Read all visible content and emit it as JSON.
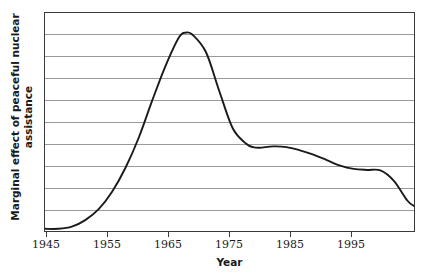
{
  "chart_data": {
    "type": "line",
    "title": "",
    "xlabel": "Year",
    "ylabel": "Marginal effect of peaceful nuclear assistance",
    "ylabel_line1": "Marginal effect of peaceful nuclear",
    "ylabel_line2": "assistance",
    "xlim": [
      1945,
      2000
    ],
    "ylim": [
      0,
      10
    ],
    "xticks": [
      1945,
      1955,
      1965,
      1975,
      1985,
      1995
    ],
    "xticklabels": [
      "1945",
      "1955",
      "1965",
      "1975",
      "1985",
      "1995"
    ],
    "yticks": [],
    "yticklabels": [],
    "grid": "horizontal",
    "gridline_count": 9,
    "legend": "none",
    "line_color": "#1a1a1a",
    "grid_color": "#9a9a9a",
    "frame_color": "#3a3a3a",
    "series": [
      {
        "name": "Marginal effect of peaceful nuclear assistance",
        "x": [
          1945,
          1947,
          1949,
          1951,
          1953,
          1955,
          1957,
          1959,
          1961,
          1963,
          1965,
          1966,
          1967,
          1969,
          1971,
          1973,
          1975,
          1976,
          1977,
          1979,
          1981,
          1983,
          1985,
          1987,
          1989,
          1991,
          1993,
          1995,
          1997,
          1999,
          2000
        ],
        "values": [
          0.1,
          0.1,
          0.2,
          0.5,
          1.0,
          1.8,
          2.9,
          4.3,
          6.0,
          7.6,
          8.9,
          9.1,
          9.0,
          8.2,
          6.4,
          4.7,
          4.0,
          3.85,
          3.82,
          3.88,
          3.85,
          3.7,
          3.5,
          3.25,
          3.0,
          2.85,
          2.8,
          2.78,
          2.3,
          1.4,
          1.15
        ]
      }
    ]
  },
  "axes": {
    "x_tick_positions_px": [
      46,
      107,
      168,
      229,
      290,
      351
    ],
    "gridline_positions_px": [
      34,
      56,
      78,
      100,
      122,
      144,
      166,
      188,
      210
    ]
  }
}
